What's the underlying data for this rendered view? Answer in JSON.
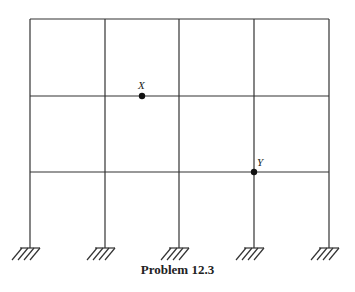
{
  "diagram": {
    "type": "multi-storey frame",
    "bays": 4,
    "storeys": 3,
    "supports": "fixed",
    "nodes": [
      {
        "label": "X",
        "location": "second floor beam, middle of second bay"
      },
      {
        "label": "Y",
        "location": "first floor beam at fourth column"
      }
    ]
  },
  "labels": {
    "x": "X",
    "y": "Y"
  },
  "caption": "Problem 12.3"
}
